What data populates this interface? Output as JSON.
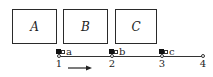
{
  "diagram": {
    "boxes": [
      {
        "label": "A",
        "x": 12,
        "y": 9,
        "w": 45,
        "h": 35
      },
      {
        "label": "B",
        "x": 63,
        "y": 9,
        "w": 45,
        "h": 35
      },
      {
        "label": "C",
        "x": 115,
        "y": 9,
        "w": 42,
        "h": 35
      }
    ],
    "stations": [
      {
        "label": "1",
        "x": 58
      },
      {
        "label": "2",
        "x": 111
      },
      {
        "label": "3",
        "x": 162
      },
      {
        "label": "4",
        "x": 202
      }
    ],
    "markers": [
      {
        "label": "a",
        "x": 58
      },
      {
        "label": "b",
        "x": 111
      },
      {
        "label": "c",
        "x": 162
      }
    ],
    "arrow": {
      "direction": "right"
    },
    "colors": {
      "line": "#333333",
      "box_border": "#2a2a2a",
      "marker_fill": "#111111"
    }
  }
}
